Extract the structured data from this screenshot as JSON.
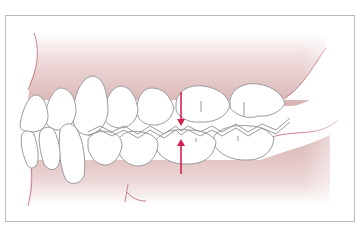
{
  "diagram": {
    "frame": {
      "x": 5,
      "y": 15,
      "width": 350,
      "height": 207,
      "stroke": "#b9b9b9"
    },
    "colors": {
      "gum_fill": "#dcb6b6",
      "gum_fill_light": "#f6eaea",
      "gum_outline": "#c9818d",
      "tooth_fill": "#ffffff",
      "tooth_outline": "#9a9a9a",
      "arrow": "#d4214f"
    },
    "arrows": [
      {
        "name": "upper-arrow-down",
        "x": 181,
        "y1": 92,
        "y2": 124,
        "direction": "down"
      },
      {
        "name": "lower-arrow-up",
        "x": 181,
        "y1": 172,
        "y2": 140,
        "direction": "up"
      }
    ],
    "contact_point": {
      "x": 181,
      "y": 131
    }
  }
}
